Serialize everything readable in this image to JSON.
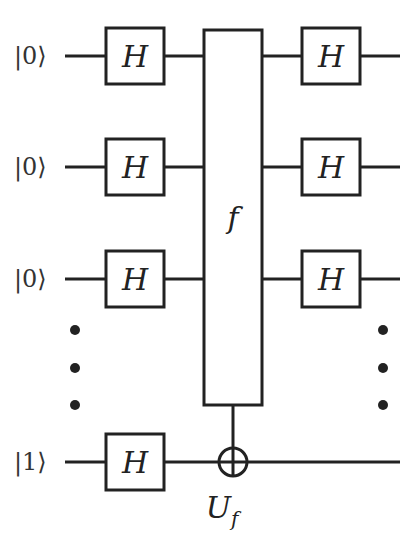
{
  "diagram": {
    "inputs": [
      {
        "ket": "|0⟩",
        "row": "input-qubit"
      },
      {
        "ket": "|0⟩",
        "row": "input-qubit"
      },
      {
        "ket": "|0⟩",
        "row": "input-qubit"
      },
      {
        "ket": "|1⟩",
        "row": "ancilla-qubit"
      }
    ],
    "gate_label": "H",
    "oracle_label": "f",
    "oracle_name": "U",
    "oracle_name_subscript": "f",
    "ellipsis": "⋮",
    "colors": {
      "ink": "#222222",
      "background": "#ffffff"
    }
  }
}
